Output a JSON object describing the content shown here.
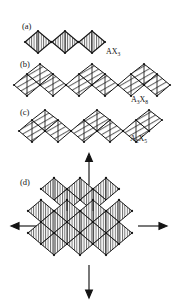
{
  "figure": {
    "type": "crystal-structure-diagram",
    "background_color": "#ffffff",
    "line_color": "#141414",
    "hatch_color": "#333333",
    "panels": [
      {
        "id": "a",
        "label": "(a)",
        "formula_text": "AX3",
        "formula_base": "AX",
        "formula_sub": "3",
        "motif": "corner-sharing-diamond-chain",
        "unit_count": 3,
        "hatching": "vertical"
      },
      {
        "id": "b",
        "label": "(b)",
        "formula_text": "A3X8",
        "formula_base_1": "A",
        "formula_sub_1": "3",
        "formula_base_2": "X",
        "formula_sub_2": "8",
        "motif": "zigzag-edge-sharing-triangle-chain",
        "unit_count": 4,
        "hatching": "diagonal"
      },
      {
        "id": "c",
        "label": "(c)",
        "formula_text": "A2X5",
        "formula_base_1": "A",
        "formula_sub_1": "2",
        "formula_base_2": "X",
        "formula_sub_2": "5",
        "motif": "zigzag-edge-sharing-triangle-chain",
        "unit_count": 3,
        "hatching": "diagonal"
      },
      {
        "id": "d",
        "label": "(d)",
        "formula_text": "",
        "motif": "two-dimensional-diamond-sheet",
        "rows": 3,
        "columns": 3,
        "hatching": "vertical",
        "arrows": [
          {
            "name": "arrow-up",
            "direction": "up"
          },
          {
            "name": "arrow-right",
            "direction": "right"
          },
          {
            "name": "arrow-down",
            "direction": "down"
          },
          {
            "name": "arrow-left",
            "direction": "left"
          }
        ]
      }
    ]
  }
}
